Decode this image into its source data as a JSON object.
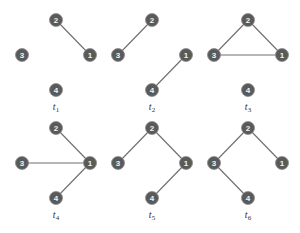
{
  "figure": {
    "node_color": "#5a5a5a",
    "edge_color": "#6e6e6e",
    "caption": "",
    "panels": [
      {
        "label": "t",
        "sub": "1",
        "origin": [
          0,
          0
        ],
        "edges": [
          [
            2,
            1
          ]
        ]
      },
      {
        "label": "t",
        "sub": "2",
        "origin": [
          96,
          0
        ],
        "edges": [
          [
            3,
            2
          ],
          [
            4,
            1
          ]
        ]
      },
      {
        "label": "t",
        "sub": "3",
        "origin": [
          192,
          0
        ],
        "edges": [
          [
            2,
            3
          ],
          [
            2,
            1
          ],
          [
            3,
            1
          ]
        ]
      },
      {
        "label": "t",
        "sub": "4",
        "origin": [
          0,
          108
        ],
        "edges": [
          [
            2,
            1
          ],
          [
            3,
            1
          ],
          [
            4,
            1
          ]
        ]
      },
      {
        "label": "t",
        "sub": "5",
        "origin": [
          96,
          108
        ],
        "edges": [
          [
            3,
            2
          ],
          [
            2,
            1
          ],
          [
            1,
            4
          ]
        ]
      },
      {
        "label": "t",
        "sub": "6",
        "origin": [
          192,
          108
        ],
        "edges": [
          [
            3,
            2
          ],
          [
            2,
            1
          ],
          [
            3,
            4
          ]
        ]
      }
    ],
    "node_layout": {
      "1": [
        90,
        55
      ],
      "2": [
        56,
        20
      ],
      "3": [
        22,
        55
      ],
      "4": [
        56,
        90
      ]
    },
    "label_pos": [
      56,
      110
    ]
  }
}
